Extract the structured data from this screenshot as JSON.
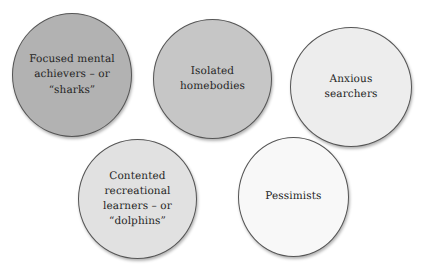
{
  "diagram": {
    "type": "bubble-cluster",
    "background_color": "#ffffff",
    "outline_color": "#555555",
    "text_color": "#262626",
    "bubbles": [
      {
        "id": "focused-mental-achievers",
        "label": "Focused mental\nachievers – or\n“sharks”",
        "fill_color": "#b2b2b2",
        "row": 1,
        "order": 1
      },
      {
        "id": "isolated-homebodies",
        "label": "Isolated\nhomebodies",
        "fill_color": "#c6c6c6",
        "row": 1,
        "order": 2
      },
      {
        "id": "anxious-searchers",
        "label": "Anxious\nsearchers",
        "fill_color": "#ededed",
        "row": 1,
        "order": 3
      },
      {
        "id": "contented-recreational-learners",
        "label": "Contented\nrecreational\nlearners – or\n“dolphins”",
        "fill_color": "#e1e1e1",
        "row": 2,
        "order": 1
      },
      {
        "id": "pessimists",
        "label": "Pessimists",
        "fill_color": "#f8f8f8",
        "row": 2,
        "order": 2
      }
    ]
  }
}
